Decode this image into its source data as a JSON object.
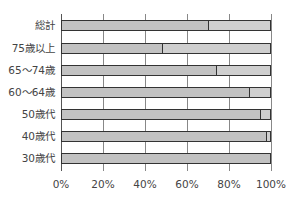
{
  "chart_data": {
    "type": "bar",
    "orientation": "horizontal",
    "stacked": true,
    "title": "",
    "xlabel": "",
    "ylabel": "",
    "categories": [
      "総計",
      "75歳以上",
      "65〜74歳",
      "60〜64歳",
      "50歳代",
      "40歳代",
      "30歳代"
    ],
    "series": [
      {
        "name": "dotted",
        "pattern": "dots",
        "color": "#e8e8e8",
        "values": [
          70,
          48,
          74,
          90,
          95,
          98,
          100
        ]
      },
      {
        "name": "gray",
        "pattern": "solid",
        "color": "#cfcfcf",
        "values": [
          30,
          52,
          26,
          10,
          5,
          2,
          0
        ]
      }
    ],
    "xlim": [
      0,
      100
    ],
    "x_ticks": [
      "0%",
      "20%",
      "40%",
      "60%",
      "80%",
      "100%"
    ],
    "grid": true,
    "legend": null
  },
  "labels": {
    "cat0": "総計",
    "cat1": "75歳以上",
    "cat2": "65〜74歳",
    "cat3": "60〜64歳",
    "cat4": "50歳代",
    "cat5": "40歳代",
    "cat6": "30歳代",
    "tick0": "0%",
    "tick1": "20%",
    "tick2": "40%",
    "tick3": "60%",
    "tick4": "80%",
    "tick5": "100%"
  }
}
